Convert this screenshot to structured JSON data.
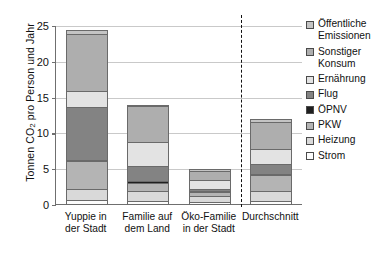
{
  "chart_data": {
    "type": "bar",
    "stacked": true,
    "title": "",
    "xlabel": "",
    "ylabel": "Tonnen CO2 pro Person und Jahr",
    "ylabel_parts": {
      "pre": "Tonnen CO",
      "sub": "2",
      "post": " pro Person und Jahr"
    },
    "ylim": [
      0,
      25
    ],
    "yticks": [
      0,
      5,
      10,
      15,
      20,
      25
    ],
    "ytick_labels": [
      "0",
      "5",
      "10",
      "15",
      "20",
      "25"
    ],
    "grid": true,
    "legend_position": "right",
    "categories": [
      "Yuppie in der Stadt",
      "Familie auf dem Land",
      "Öko-Familie in der Stadt",
      "Durchschnitt"
    ],
    "category_lines": [
      [
        "Yuppie in",
        "der Stadt"
      ],
      [
        "Familie auf",
        "dem Land"
      ],
      [
        "Öko-Familie",
        "in der Stadt"
      ],
      [
        "Durchschnitt"
      ]
    ],
    "separator_after_category": 2,
    "series": [
      {
        "name": "Strom",
        "color": "#fcfcfc",
        "values": [
          0.7,
          0.6,
          0.4,
          0.6
        ]
      },
      {
        "name": "Heizung",
        "color": "#d9d9d9",
        "values": [
          1.6,
          1.3,
          0.9,
          1.3
        ]
      },
      {
        "name": "PKW",
        "color": "#b4b4b4",
        "values": [
          3.8,
          1.2,
          0.5,
          2.3
        ]
      },
      {
        "name": "ÖPNV",
        "color": "#1f1f1f",
        "values": [
          0.2,
          0.2,
          0.1,
          0.2
        ]
      },
      {
        "name": "Flug",
        "color": "#838383",
        "values": [
          7.4,
          2.1,
          0.3,
          1.4
        ]
      },
      {
        "name": "Ernährung",
        "color": "#e3e3e3",
        "values": [
          2.2,
          3.4,
          1.2,
          2.0
        ]
      },
      {
        "name": "Sonstiger Konsum",
        "color": "#aeaeae",
        "values": [
          8.0,
          5.0,
          1.3,
          3.8
        ]
      },
      {
        "name": "Öffentliche Emissionen",
        "color": "#c4c4c4",
        "values": [
          0.6,
          0.2,
          0.3,
          0.4
        ]
      }
    ],
    "totals": [
      24.5,
      14.0,
      5.0,
      12.0
    ]
  },
  "legend": {
    "entries": [
      {
        "label": "Öffentliche Emissionen",
        "color": "#c4c4c4"
      },
      {
        "label": "Sonstiger Konsum",
        "color": "#aeaeae"
      },
      {
        "label": "Ernährung",
        "color": "#e3e3e3"
      },
      {
        "label": "Flug",
        "color": "#838383"
      },
      {
        "label": "ÖPNV",
        "color": "#1f1f1f"
      },
      {
        "label": "PKW",
        "color": "#b4b4b4"
      },
      {
        "label": "Heizung",
        "color": "#d9d9d9"
      },
      {
        "label": "Strom",
        "color": "#fcfcfc"
      }
    ]
  }
}
